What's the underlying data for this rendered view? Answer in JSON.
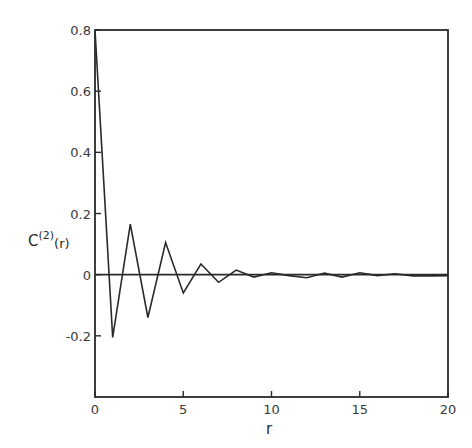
{
  "chart_data": {
    "type": "line",
    "title": "",
    "xlabel": "r",
    "ylabel": "C(2)(r)",
    "ylabel_parts": {
      "base": "C",
      "superscript": "(2)",
      "arg": "(r)"
    },
    "xlim": [
      0,
      20
    ],
    "ylim": [
      -0.4,
      0.8
    ],
    "x_ticks": [
      0,
      5,
      10,
      15,
      20
    ],
    "x_tick_labels": [
      "0",
      "5",
      "10",
      "15",
      "20"
    ],
    "y_ticks": [
      0.8,
      0.6,
      0.4,
      0.2,
      0,
      -0.2
    ],
    "y_tick_labels": [
      "0.8",
      "0.6",
      "0.4",
      "0.2",
      "0",
      "-0.2"
    ],
    "grid": false,
    "legend": null,
    "zero_line": true,
    "series": [
      {
        "name": "C(2)(r)",
        "x": [
          0,
          1,
          2,
          3,
          4,
          5,
          6,
          7,
          8,
          9,
          10,
          11,
          12,
          13,
          14,
          15,
          16,
          17,
          18,
          19,
          20
        ],
        "values": [
          0.8,
          -0.205,
          0.165,
          -0.14,
          0.105,
          -0.06,
          0.035,
          -0.025,
          0.015,
          -0.008,
          0.006,
          -0.003,
          -0.01,
          0.005,
          -0.008,
          0.006,
          -0.003,
          0.003,
          -0.004,
          -0.004,
          -0.003
        ]
      }
    ]
  },
  "colors": {
    "ink": "#2a2a2a",
    "background": "#ffffff"
  }
}
